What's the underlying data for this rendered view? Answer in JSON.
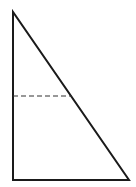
{
  "diagram": {
    "type": "right-triangle-with-dashed-segment",
    "stroke_color": "#1a1a1a",
    "dash_color": "#333333",
    "background": "#ffffff",
    "vertices": {
      "top": [
        13,
        12
      ],
      "bottom_left": [
        13,
        180
      ],
      "bottom_right": [
        129,
        180
      ]
    },
    "dashed_segment": {
      "from": [
        13,
        96
      ],
      "to": [
        72,
        96
      ]
    }
  }
}
